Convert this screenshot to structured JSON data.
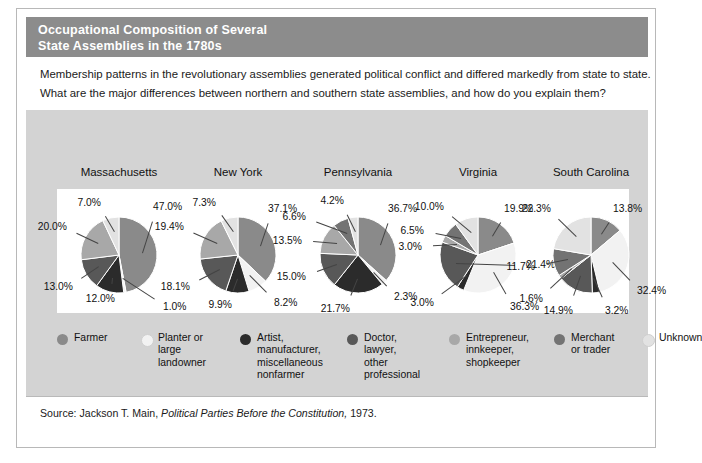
{
  "figure": {
    "title_line_1": "Occupational Composition of Several",
    "title_line_2": "State Assemblies in the 1780s",
    "title_bar_color": "#8c8c8c",
    "panel_bg_color": "#d3d3d3",
    "prompt_line_1": "Membership patterns in the revolutionary assemblies generated political conflict and differed markedly from state to state.",
    "prompt_line_2": "What are the major differences between northern and southern state assemblies, and how do you explain them?",
    "source_prefix": "Source: Jackson T. Main,",
    "source_italic": "Political Parties Before the Constitution,",
    "source_suffix": "1973."
  },
  "legend": {
    "items": [
      {
        "label": "Farmer",
        "color": "#8a8a8a"
      },
      {
        "label": "Planter or\nlarge\nlandowner",
        "color": "#f2f2f2"
      },
      {
        "label": "Artist,\nmanufacturer,\nmiscellaneous\nnonfarmer",
        "color": "#2b2b2b"
      },
      {
        "label": "Doctor,\nlawyer,\nother\nprofessional",
        "color": "#585858"
      },
      {
        "label": "Entrepreneur,\ninnkeeper,\nshopkeeper",
        "color": "#a8a8a8"
      },
      {
        "label": "Merchant\nor trader",
        "color": "#737373"
      },
      {
        "label": "Unknown",
        "color": "#e2e2e2"
      }
    ]
  },
  "chart_data": {
    "type": "pie",
    "title": "Occupational Composition of Several State Assemblies in the 1780s",
    "legend_position": "bottom",
    "categories": [
      "Farmer",
      "Planter or large landowner",
      "Artist, manufacturer, miscellaneous nonfarmer",
      "Doctor, lawyer, other professional",
      "Entrepreneur, innkeeper, shopkeeper",
      "Merchant or trader",
      "Unknown"
    ],
    "category_colors": [
      "#8a8a8a",
      "#f2f2f2",
      "#2b2b2b",
      "#585858",
      "#a8a8a8",
      "#737373",
      "#e2e2e2"
    ],
    "pies": [
      {
        "name": "Massachusetts",
        "slices": [
          {
            "category": "Farmer",
            "value": 47.0,
            "label": "47.0%"
          },
          {
            "category": "Planter or large landowner",
            "value": 1.0,
            "label": "1.0%"
          },
          {
            "category": "Artist, manufacturer, miscellaneous nonfarmer",
            "value": 12.0,
            "label": "12.0%"
          },
          {
            "category": "Doctor, lawyer, other professional",
            "value": 13.0,
            "label": "13.0%"
          },
          {
            "category": "Entrepreneur, innkeeper, shopkeeper",
            "value": 20.0,
            "label": "20.0%"
          },
          {
            "category": "Unknown",
            "value": 7.0,
            "label": "7.0%"
          }
        ]
      },
      {
        "name": "New York",
        "slices": [
          {
            "category": "Farmer",
            "value": 37.1,
            "label": "37.1%"
          },
          {
            "category": "Planter or large landowner",
            "value": 8.2,
            "label": "8.2%"
          },
          {
            "category": "Artist, manufacturer, miscellaneous nonfarmer",
            "value": 9.9,
            "label": "9.9%"
          },
          {
            "category": "Doctor, lawyer, other professional",
            "value": 18.1,
            "label": "18.1%"
          },
          {
            "category": "Entrepreneur, innkeeper, shopkeeper",
            "value": 19.4,
            "label": "19.4%"
          },
          {
            "category": "Unknown",
            "value": 7.3,
            "label": "7.3%"
          }
        ]
      },
      {
        "name": "Pennsylvania",
        "slices": [
          {
            "category": "Farmer",
            "value": 36.7,
            "label": "36.7%"
          },
          {
            "category": "Planter or large landowner",
            "value": 2.3,
            "label": "2.3%"
          },
          {
            "category": "Artist, manufacturer, miscellaneous nonfarmer",
            "value": 21.7,
            "label": "21.7%"
          },
          {
            "category": "Doctor, lawyer, other professional",
            "value": 15.0,
            "label": "15.0%"
          },
          {
            "category": "Entrepreneur, innkeeper, shopkeeper",
            "value": 13.5,
            "label": "13.5%"
          },
          {
            "category": "Merchant or trader",
            "value": 6.6,
            "label": "6.6%"
          },
          {
            "category": "Unknown",
            "value": 4.2,
            "label": "4.2%"
          }
        ]
      },
      {
        "name": "Virginia",
        "slices": [
          {
            "category": "Farmer",
            "value": 19.9,
            "label": "19.9%"
          },
          {
            "category": "Planter or large landowner",
            "value": 36.3,
            "label": "36.3%"
          },
          {
            "category": "Artist, manufacturer, miscellaneous nonfarmer",
            "value": 3.0,
            "label": "3.0%"
          },
          {
            "category": "Doctor, lawyer, other professional",
            "value": 21.4,
            "label": "21.4%"
          },
          {
            "category": "Entrepreneur, innkeeper, shopkeeper",
            "value": 3.0,
            "label": "3.0%"
          },
          {
            "category": "Merchant or trader",
            "value": 6.5,
            "label": "6.5%"
          },
          {
            "category": "Unknown",
            "value": 10.0,
            "label": "10.0%"
          }
        ]
      },
      {
        "name": "South Carolina",
        "slices": [
          {
            "category": "Farmer",
            "value": 13.8,
            "label": "13.8%"
          },
          {
            "category": "Planter or large landowner",
            "value": 32.4,
            "label": "32.4%"
          },
          {
            "category": "Artist, manufacturer, miscellaneous nonfarmer",
            "value": 3.2,
            "label": "3.2%"
          },
          {
            "category": "Doctor, lawyer, other professional",
            "value": 14.9,
            "label": "14.9%"
          },
          {
            "category": "Entrepreneur, innkeeper, shopkeeper",
            "value": 1.6,
            "label": "1.6%"
          },
          {
            "category": "Merchant or trader",
            "value": 11.7,
            "label": "11.7%"
          },
          {
            "category": "Unknown",
            "value": 22.3,
            "label": "22.3%"
          }
        ]
      }
    ]
  }
}
